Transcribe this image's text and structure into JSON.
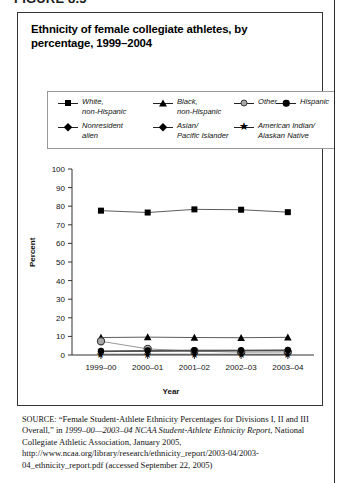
{
  "figure_label": "FIGURE 8.5",
  "figure": {
    "title": "Ethnicity of female collegiate athletes, by percentage, 1999–2004"
  },
  "legend": {
    "items": [
      {
        "label": "White,\nnon-Hispanic",
        "marker": "square-marker",
        "name": "legend-item-white-non-hispanic"
      },
      {
        "label": "Black,\nnon-Hispanic",
        "marker": "triangle-marker",
        "name": "legend-item-black-non-hispanic"
      },
      {
        "label": "Other",
        "marker": "open-circle-marker",
        "name": "legend-item-other"
      },
      {
        "label": "Hispanic",
        "marker": "filled-circle-marker",
        "name": "legend-item-hispanic"
      },
      {
        "label": "Nonresident\nalien",
        "marker": "diamond-marker",
        "name": "legend-item-nonresident-alien"
      },
      {
        "label": "Asian/\nPacific Islander",
        "marker": "diamond-marker",
        "name": "legend-item-asian-pacific-islander"
      },
      {
        "label": "American Indian/\nAlaskan Native",
        "marker": "star-marker",
        "name": "legend-item-american-indian-alaskan-native"
      }
    ]
  },
  "source": {
    "prefix": "SOURCE:",
    "text_part1": " “Female Student-Athlete Ethnicity Percentages for Divisions I, II and III Overall,” in ",
    "italic_part": "1999–00—2003–04 NCAA Student-Athlete Ethnicity Report",
    "text_part2": ", National Collegiate Athletic Association, January 2005, http://www.ncaa.org/library/research/ethnicity_report/2003-04/2003-04_ethnicity_report.pdf (accessed September 22, 2005)"
  },
  "chart_data": {
    "type": "line",
    "title": "Ethnicity of female collegiate athletes, by percentage, 1999–2004",
    "xlabel": "Year",
    "ylabel": "Percent",
    "categories": [
      "1999–00",
      "2000–01",
      "2001–02",
      "2002–03",
      "2003–04"
    ],
    "ylim": [
      0,
      100
    ],
    "yticks": [
      0,
      10,
      20,
      30,
      40,
      50,
      60,
      70,
      80,
      90,
      100
    ],
    "grid": false,
    "legend_position": "top",
    "series": [
      {
        "name": "White, non-Hispanic",
        "marker": "square",
        "color": "#000000",
        "values": [
          77.6,
          76.6,
          78.3,
          78.1,
          76.8
        ]
      },
      {
        "name": "Black, non-Hispanic",
        "marker": "triangle",
        "color": "#000000",
        "values": [
          9.4,
          9.6,
          9.4,
          9.3,
          9.5
        ]
      },
      {
        "name": "Other",
        "marker": "open-circle",
        "color": "#a8a8a8",
        "values": [
          7.4,
          3.3,
          2.1,
          1.5,
          1.6
        ]
      },
      {
        "name": "Hispanic",
        "marker": "filled-circle",
        "color": "#000000",
        "values": [
          2.2,
          2.4,
          2.6,
          2.6,
          2.7
        ]
      },
      {
        "name": "Nonresident alien",
        "marker": "diamond",
        "color": "#000000",
        "values": [
          1.9,
          2.1,
          2.3,
          2.4,
          2.5
        ]
      },
      {
        "name": "Asian/Pacific Islander",
        "marker": "diamond",
        "color": "#000000",
        "values": [
          1.8,
          2.0,
          2.1,
          2.2,
          2.3
        ]
      },
      {
        "name": "American Indian/Alaskan Native",
        "marker": "star",
        "color": "#000000",
        "values": [
          0.4,
          0.4,
          0.4,
          0.4,
          0.4
        ]
      }
    ]
  }
}
